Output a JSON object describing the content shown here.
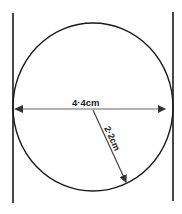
{
  "diagram": {
    "type": "geometry",
    "shape": "circle between two parallel tangent lines",
    "diameter_label": "4·4cm",
    "radius_label": "2·2cm",
    "colors": {
      "stroke": "#1a1a1a",
      "arrow": "#555555",
      "background": "#ffffff"
    }
  }
}
